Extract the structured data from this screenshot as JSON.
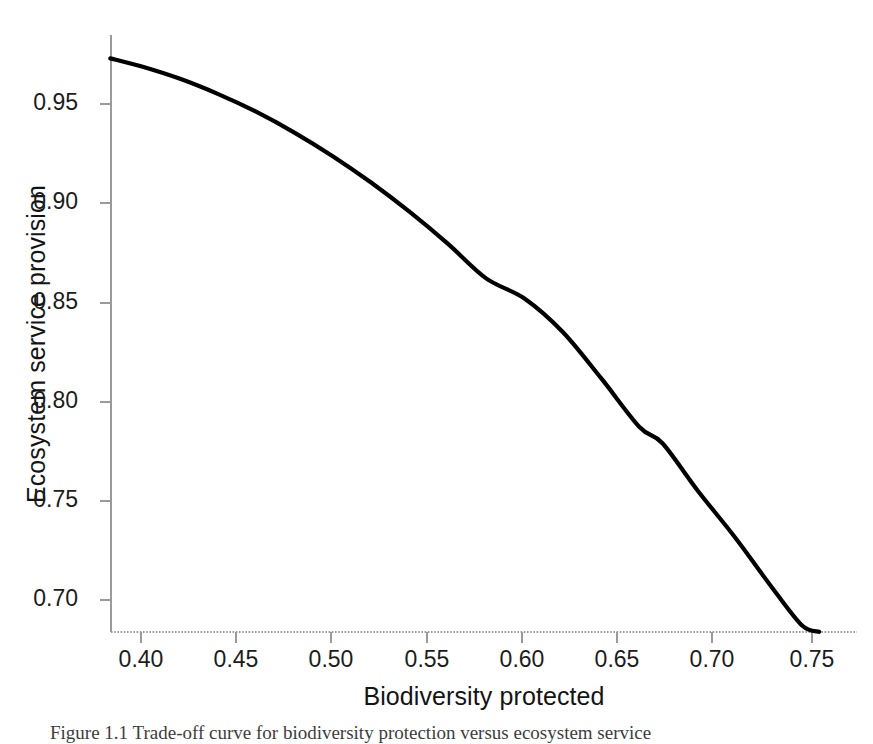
{
  "figure": {
    "background_color": "#ffffff",
    "caption_partial": "Figure 1.1   Trade-off curve for biodiversity protection versus ecosystem service"
  },
  "chart_data": {
    "type": "line",
    "title": "",
    "subtitle": "",
    "xlabel": "Biodiversity protected",
    "ylabel": "Ecosystem service provision",
    "xlim": [
      0.3793,
      0.7786
    ],
    "ylim": [
      0.684,
      0.9847
    ],
    "xticks": [
      0.4,
      0.45,
      0.5,
      0.55,
      0.6,
      0.65,
      0.7,
      0.75
    ],
    "xtick_labels": [
      "0.40",
      "0.45",
      "0.50",
      "0.55",
      "0.60",
      "0.65",
      "0.70",
      "0.75"
    ],
    "yticks": [
      0.7,
      0.75,
      0.8,
      0.85,
      0.9,
      0.95
    ],
    "ytick_labels": [
      "0.70",
      "0.75",
      "0.80",
      "0.85",
      "0.90",
      "0.95"
    ],
    "grid": false,
    "legend": null,
    "legend_position": "none",
    "line_color": "#000000",
    "line_width": 4.2,
    "axis_color": "#9a9a9a",
    "series": [
      {
        "name": "Trade-off frontier",
        "x": [
          0.384,
          0.4,
          0.42,
          0.44,
          0.46,
          0.48,
          0.5,
          0.52,
          0.54,
          0.56,
          0.58,
          0.6,
          0.62,
          0.64,
          0.66,
          0.672,
          0.69,
          0.71,
          0.73,
          0.745,
          0.7537
        ],
        "y": [
          0.973,
          0.969,
          0.9628,
          0.9551,
          0.9461,
          0.9356,
          0.9237,
          0.9104,
          0.8957,
          0.8796,
          0.8621,
          0.852,
          0.8351,
          0.8118,
          0.7872,
          0.779,
          0.7556,
          0.7314,
          0.7052,
          0.687,
          0.684
        ]
      }
    ]
  },
  "axes_geometry": {
    "plot_left_px": 111,
    "plot_right_px": 857,
    "plot_top_px": 35,
    "plot_bottom_px": 632,
    "x_tick_px": [
      141,
      236,
      331,
      427,
      522,
      617,
      712,
      812
    ],
    "y_tick_px": [
      600,
      501,
      402,
      303,
      203,
      104
    ]
  }
}
